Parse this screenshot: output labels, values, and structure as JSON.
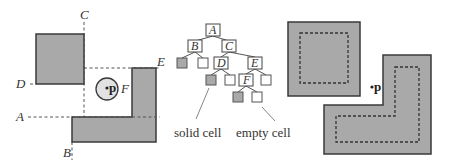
{
  "colors": {
    "solid_fill": "#a9a9a9",
    "outline": "#3a3a3a",
    "circle_fill": "#e2e2e2",
    "dash": "#555555",
    "background": "#ffffff"
  },
  "left_panel": {
    "split_labels": {
      "A": "A",
      "B": "B",
      "C": "C",
      "D": "D",
      "E": "E",
      "F": "F"
    },
    "point_label": "p"
  },
  "tree": {
    "nodes": [
      {
        "id": "A",
        "label": "A",
        "type": "internal"
      },
      {
        "id": "B",
        "label": "B",
        "type": "internal"
      },
      {
        "id": "C",
        "label": "C",
        "type": "internal"
      },
      {
        "id": "D",
        "label": "D",
        "type": "internal"
      },
      {
        "id": "E",
        "label": "E",
        "type": "internal"
      },
      {
        "id": "F",
        "label": "F",
        "type": "internal"
      },
      {
        "id": "B-left",
        "label": "",
        "type": "solid"
      },
      {
        "id": "B-right",
        "label": "",
        "type": "empty"
      },
      {
        "id": "D-left",
        "label": "",
        "type": "solid"
      },
      {
        "id": "D-right",
        "label": "",
        "type": "empty"
      },
      {
        "id": "E-right",
        "label": "",
        "type": "empty"
      },
      {
        "id": "F-left",
        "label": "",
        "type": "solid"
      },
      {
        "id": "F-right",
        "label": "",
        "type": "empty"
      }
    ],
    "captions": {
      "solid": "solid cell",
      "empty": "empty cell"
    }
  },
  "right_panel": {
    "point_label": "p"
  }
}
